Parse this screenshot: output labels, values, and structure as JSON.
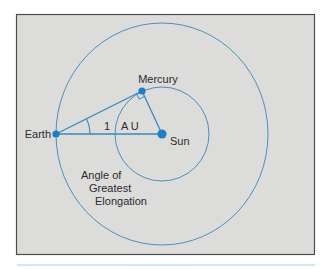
{
  "diagram": {
    "type": "orbital-geometry",
    "colors": {
      "panel_background": "#dcdddb",
      "panel_border": "#4d4d4d",
      "orbit_line": "#4a90bd",
      "construction_line": "#3a87bd",
      "body_dot": "#1f7fc4",
      "rule_line": "#9fd3e3",
      "text": "#2b2b2b"
    },
    "bodies": [
      {
        "id": "earth",
        "label": "Earth"
      },
      {
        "id": "mercury",
        "label": "Mercury"
      },
      {
        "id": "sun",
        "label": "Sun"
      }
    ],
    "labels": {
      "earth": "Earth",
      "mercury": "Mercury",
      "sun": "Sun",
      "distance_number": "1",
      "distance_unit": "A U",
      "angle_line1": "Angle of",
      "angle_line2": "Greatest",
      "angle_line3": "Elongation"
    },
    "orbits": [
      {
        "name": "Earth orbit",
        "center": "sun"
      },
      {
        "name": "Mercury orbit",
        "center": "sun"
      }
    ],
    "annotations": {
      "right_angle_at": "mercury",
      "angle_marked_at": "earth"
    }
  }
}
